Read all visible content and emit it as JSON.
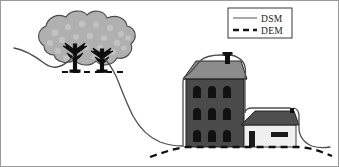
{
  "figure": {
    "background_color": "#ffffff",
    "border_color": "#9a9a9a"
  },
  "legend": {
    "name": "legend-box",
    "border_color": "#3a3a3a",
    "background_color": "#ffffff",
    "box": {
      "x": 228,
      "y": 8,
      "width": 64,
      "height": 30
    },
    "entries": [
      {
        "label": "DSM",
        "line_style": "solid",
        "color": "#6e6e6e",
        "sample_x1": 233,
        "sample_x2": 258,
        "sample_y": 17
      },
      {
        "label": "DEM",
        "line_style": "dashed",
        "color": "#141414",
        "sample_x1": 233,
        "sample_x2": 258,
        "sample_y": 29
      }
    ]
  },
  "scene": {
    "trees": {
      "name": "tree-cluster",
      "canopy_fill": "#b0b0b0",
      "canopy_stroke": "#4a4a4a",
      "canopy_dot_fill": "#c4c4c4",
      "trunk_color": "#0d0d0d",
      "count": 2,
      "trunks": [
        {
          "x": 75,
          "base_y": 70,
          "top_y": 46
        },
        {
          "x": 102,
          "base_y": 70,
          "top_y": 50
        }
      ]
    },
    "main_building": {
      "name": "main-building",
      "facade_fill": "#4a4a4a",
      "facade_stroke": "#1c1c1c",
      "roof_fill": "#8c8c8c",
      "roof_stroke": "#2a2a2a",
      "chimney_fill": "#101010",
      "window_fill": "#111111",
      "window_rows": 3,
      "window_cols": 3,
      "body": {
        "x": 186,
        "y": 79,
        "width": 58,
        "height": 68
      }
    },
    "annex_building": {
      "name": "annex-building",
      "wall_fill": "#efefef",
      "wall_stroke": "#2a2a2a",
      "roof_fill": "#4f4f4f",
      "roof_stroke": "#1c1c1c",
      "door_fill": "#1a1a1a",
      "window_fill": "#1a1a1a",
      "body": {
        "x": 244,
        "y": 125,
        "width": 52,
        "height": 22
      }
    },
    "dsm_line": {
      "name": "dsm-profile-line",
      "label": "DSM",
      "style": "solid",
      "color": "#4d4d4d",
      "width": 1.3
    },
    "dem_line": {
      "name": "dem-profile-line",
      "label": "DEM",
      "style": "dashed",
      "color": "#0f0f0f",
      "width": 2.2,
      "dash_pattern": "7,5"
    }
  }
}
